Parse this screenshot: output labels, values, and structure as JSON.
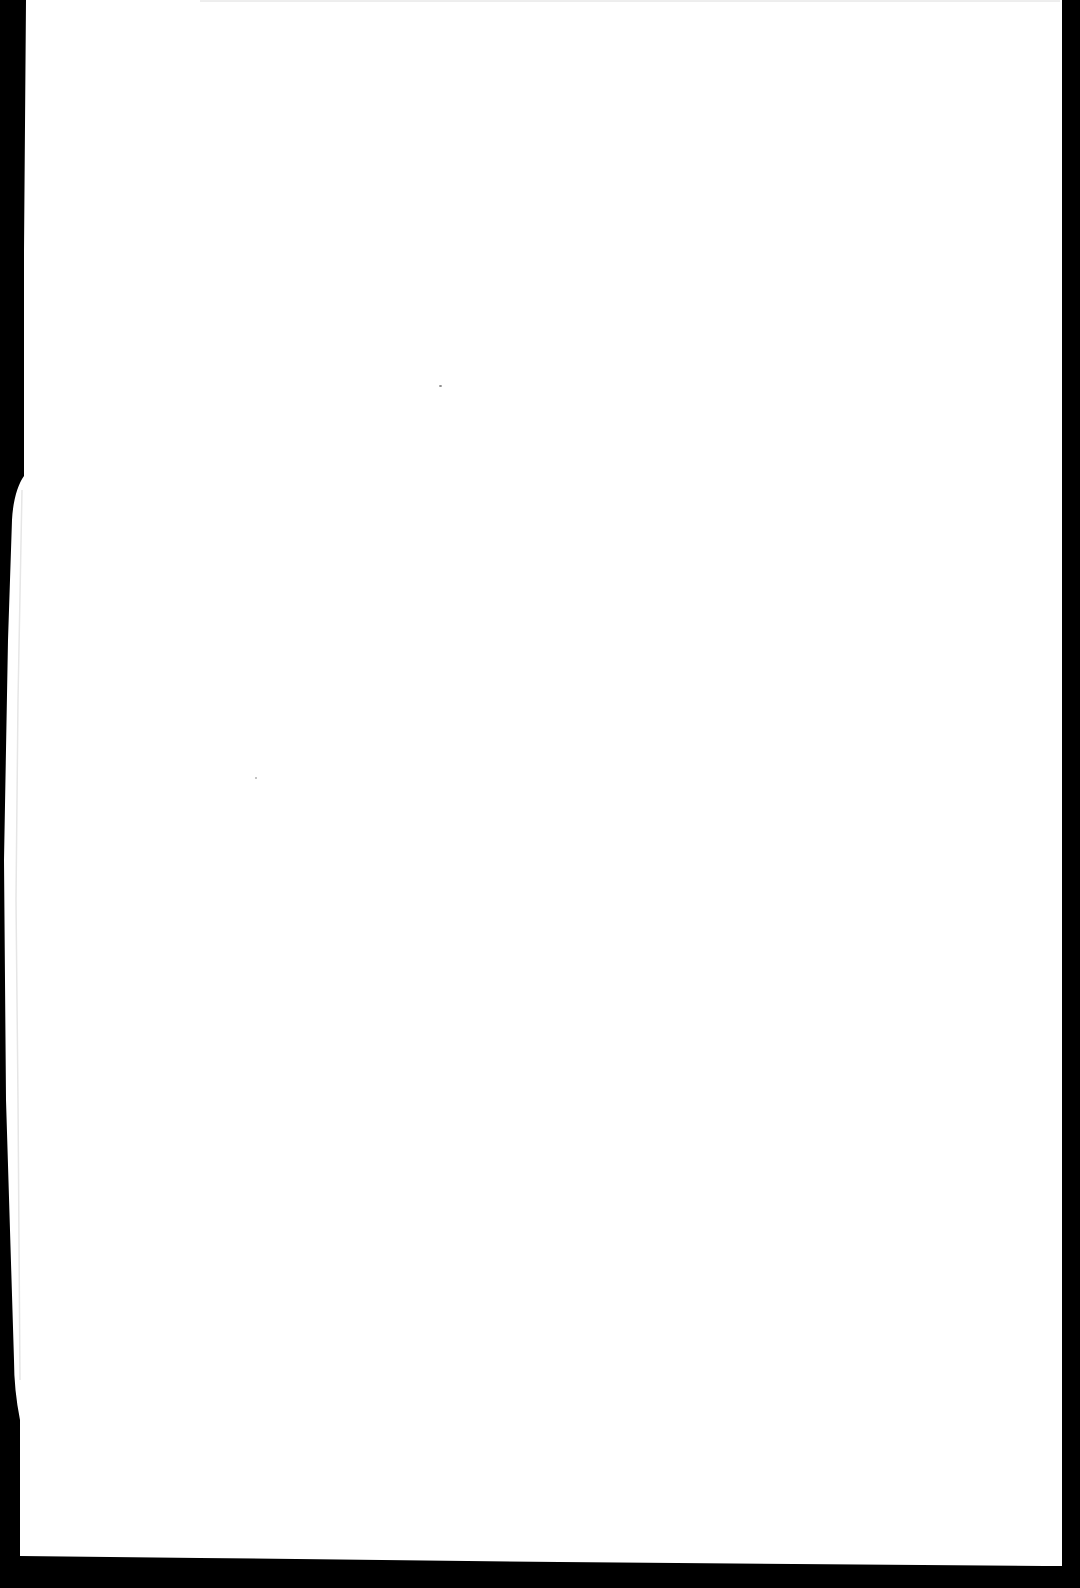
{
  "document": {
    "type": "scanned-blank-page",
    "text_content": "",
    "colors": {
      "paper": "#ffffff",
      "scanner_background": "#000000",
      "speck": "#8a8a8a",
      "edge_shadow": "#e6e6e6"
    },
    "specks": [
      {
        "x": 440,
        "y": 386,
        "size": 3
      },
      {
        "x": 256,
        "y": 778,
        "size": 2
      }
    ]
  }
}
